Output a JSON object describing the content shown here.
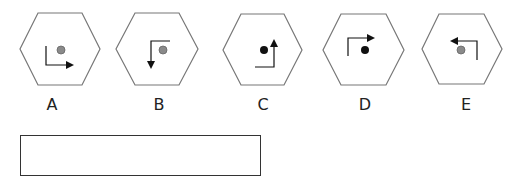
{
  "question": {
    "options": [
      {
        "label": "A",
        "cx": 60,
        "dot_color": "#8a8a8a",
        "arrow": {
          "points": "46,46 46,65 73,65",
          "head": "right"
        }
      },
      {
        "label": "B",
        "cx": 157,
        "dot_color": "#8a8a8a",
        "arrow": {
          "points": "170,41 151,41 151,68",
          "head": "down"
        }
      },
      {
        "label": "C",
        "cx": 262,
        "dot_color": "#111111",
        "arrow": {
          "points": "255,67 274,67 274,40",
          "head": "up"
        }
      },
      {
        "label": "D",
        "cx": 364,
        "dot_color": "#111111",
        "arrow": {
          "points": "348,56 348,38 374,38",
          "head": "right"
        }
      },
      {
        "label": "E",
        "cx": 462,
        "dot_color": "#8a8a8a",
        "arrow": {
          "points": "477,60 477,41 451,41",
          "head": "left"
        }
      }
    ],
    "dots": [
      {
        "x": 61,
        "y": 50
      },
      {
        "x": 163,
        "y": 50
      },
      {
        "x": 264,
        "y": 50
      },
      {
        "x": 365,
        "y": 50
      },
      {
        "x": 461,
        "y": 50
      }
    ],
    "answer_box": {
      "value": ""
    }
  },
  "colors": {
    "stroke": "#777777",
    "arrow": "#111111"
  }
}
